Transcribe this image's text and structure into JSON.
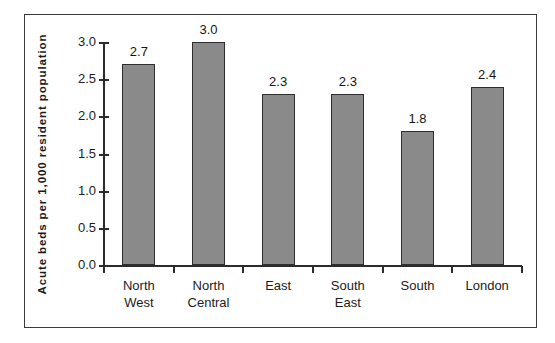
{
  "chart_data": {
    "type": "bar",
    "title": "",
    "xlabel": "",
    "ylabel": "Acute  beds  per  1,000  resident  population",
    "categories": [
      "North West",
      "North Central",
      "East",
      "South East",
      "South",
      "London"
    ],
    "category_lines": [
      [
        "North",
        "West"
      ],
      [
        "North",
        "Central"
      ],
      [
        "East"
      ],
      [
        "South",
        "East"
      ],
      [
        "South"
      ],
      [
        "London"
      ]
    ],
    "values": [
      2.7,
      3.0,
      2.3,
      2.3,
      1.8,
      2.4
    ],
    "value_labels": [
      "2.7",
      "3.0",
      "2.3",
      "2.3",
      "1.8",
      "2.4"
    ],
    "ylim": [
      0.0,
      3.0
    ],
    "yticks": [
      0.0,
      0.5,
      1.0,
      1.5,
      2.0,
      2.5,
      3.0
    ],
    "ytick_labels": [
      "0.0",
      "0.5",
      "1.0",
      "1.5",
      "2.0",
      "2.5",
      "3.0"
    ],
    "grid": false,
    "legend": null,
    "bar_color": "#8a8a8a",
    "bar_edge_color": "#2e2e2e",
    "axis_color": "#2b2b2b",
    "frame_color": "#3a3a3a",
    "background": "#ffffff"
  }
}
